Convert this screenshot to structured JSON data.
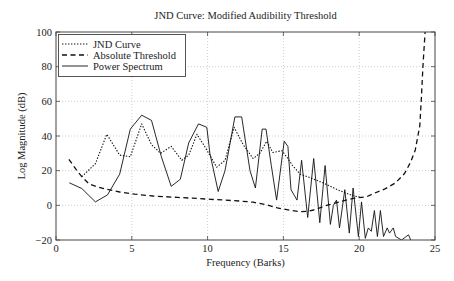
{
  "chart_data": {
    "type": "line",
    "title": "JND Curve: Modified Audibility Threshold",
    "xlabel": "Frequency (Barks)",
    "ylabel": "Log Magnitude (dB)",
    "xlim": [
      0,
      25
    ],
    "ylim": [
      -20,
      100
    ],
    "xticks": [
      0,
      5,
      10,
      15,
      20,
      25
    ],
    "xtick_labels": [
      "0",
      "5",
      "10",
      "15",
      "20",
      "25"
    ],
    "yticks": [
      -20,
      0,
      20,
      40,
      60,
      80,
      100
    ],
    "ytick_labels": [
      "−20",
      "0",
      "20",
      "40",
      "60",
      "80",
      "100"
    ],
    "grid": true,
    "legend_position": "upper left",
    "legend": [
      "JND Curve",
      "Absolute Threshold",
      "Power Spectrum"
    ],
    "series": [
      {
        "name": "JND Curve",
        "style": "dotted",
        "color": "#111111",
        "x": [
          1.7,
          2.6,
          3.35,
          4.2,
          4.9,
          5.65,
          6.3,
          6.9,
          7.6,
          8.3,
          8.75,
          9.3,
          9.95,
          10.6,
          11.15,
          11.75,
          12.35,
          13.0,
          13.45,
          13.9,
          14.3,
          14.9,
          15.3,
          15.6,
          16.1,
          16.75,
          17.6,
          18.7,
          19.6,
          20.1
        ],
        "y": [
          16.5,
          24,
          41,
          29,
          28,
          47,
          35,
          30,
          34,
          26,
          29,
          41,
          32,
          22,
          26,
          45,
          35,
          27,
          30,
          37,
          30.5,
          31.5,
          27,
          23,
          18,
          16,
          13,
          8.5,
          5.5,
          4.7
        ]
      },
      {
        "name": "Absolute Threshold",
        "style": "dashed",
        "color": "#111111",
        "x": [
          0.85,
          1.3,
          1.7,
          2.2,
          2.8,
          3.3,
          4.2,
          5.2,
          6.4,
          8.0,
          9.0,
          10.2,
          11.0,
          12.1,
          13.0,
          13.8,
          14.6,
          15.5,
          16.1,
          16.65,
          17.0,
          17.85,
          18.7,
          19.6,
          20.5,
          21.0,
          21.7,
          22.4,
          23.0,
          23.4,
          23.7,
          24.0,
          24.1,
          24.2,
          24.35,
          24.45
        ],
        "y": [
          26.5,
          21,
          16.5,
          12.2,
          10.5,
          9.3,
          7.7,
          6.4,
          5.4,
          4.6,
          4.1,
          3.5,
          3.1,
          2.5,
          1.8,
          0.5,
          -1.4,
          -3.0,
          -3.7,
          -3.4,
          -2.7,
          0,
          2,
          4,
          5,
          7,
          9.5,
          13,
          18.5,
          25,
          32,
          46,
          62,
          80,
          100,
          108
        ]
      },
      {
        "name": "Power Spectrum",
        "style": "solid",
        "color": "#111111",
        "x": [
          0.88,
          1.7,
          2.6,
          3.4,
          4.2,
          4.9,
          5.65,
          6.3,
          6.95,
          7.6,
          8.2,
          8.75,
          9.4,
          9.95,
          10.15,
          10.7,
          11.15,
          11.8,
          12.25,
          12.8,
          13.15,
          13.6,
          13.85,
          14.2,
          14.55,
          15.05,
          15.3,
          15.5,
          15.9,
          16.2,
          16.6,
          17.0,
          17.4,
          17.75,
          18.1,
          18.3,
          18.5,
          18.7,
          19.05,
          19.35,
          19.6,
          19.95,
          20.15,
          20.4,
          20.6,
          20.8,
          21.0,
          21.2,
          21.4,
          21.6,
          21.85,
          22.0,
          22.25,
          22.4,
          22.8,
          23.25,
          23.4
        ],
        "y": [
          13,
          9.7,
          2,
          6,
          18,
          44,
          52,
          49,
          28,
          11,
          15,
          36,
          47,
          45,
          30,
          8,
          20,
          51,
          51,
          20,
          10,
          44,
          44,
          23,
          3,
          37,
          34,
          9,
          3,
          26,
          -7,
          27,
          -10,
          23,
          -11,
          0,
          3,
          -13,
          9,
          -16,
          10,
          -18,
          2,
          -19,
          -13,
          -15,
          -3,
          -18,
          -3,
          -18,
          -13,
          -16,
          -13,
          -18,
          -20,
          -17,
          -20
        ]
      }
    ]
  }
}
